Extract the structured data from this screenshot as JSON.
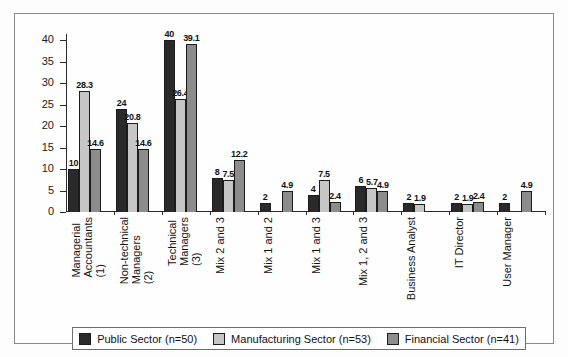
{
  "chart_data": {
    "type": "bar",
    "title": "",
    "subtitle": "",
    "xlabel": "",
    "ylabel": "",
    "ylim": [
      0,
      41.5
    ],
    "yticks": [
      0,
      5,
      10,
      15,
      20,
      25,
      30,
      35,
      40
    ],
    "grid": false,
    "legend_position": "bottom",
    "orientation": "vertical",
    "grouping": "grouped",
    "categories": [
      "Managerial Accountants (1)",
      "Non-technical Managers (2)",
      "Technical Managers (3)",
      "Mix 2 and 3",
      "Mix 1 and 2",
      "Mix 1 and 3",
      "Mix 1, 2 and 3",
      "Business Analyst",
      "IT Director",
      "User Manager"
    ],
    "category_lines": [
      [
        "Managerial",
        "Accountants",
        "(1)"
      ],
      [
        "Non-technical",
        "Managers",
        "(2)"
      ],
      [
        "Technical",
        "Managers",
        "(3)"
      ],
      [
        "Mix 2 and 3"
      ],
      [
        "Mix 1 and 2"
      ],
      [
        "Mix 1 and 3"
      ],
      [
        "Mix 1, 2 and 3"
      ],
      [
        "Business Analyst"
      ],
      [
        "IT Director"
      ],
      [
        "User Manager"
      ]
    ],
    "series": [
      {
        "name": "Public Sector (n=50)",
        "color": "#2a2a2a",
        "values": [
          10,
          24,
          40,
          8,
          2,
          4,
          6,
          2,
          2,
          2
        ],
        "labels": [
          "10",
          "24",
          "40",
          "8",
          "2",
          "4",
          "6",
          "2",
          "2",
          "2"
        ]
      },
      {
        "name": "Manufacturing Sector (n=53)",
        "color": "#c6c6c6",
        "values": [
          28.3,
          20.8,
          26.4,
          7.5,
          null,
          7.5,
          5.7,
          1.9,
          1.9,
          null
        ],
        "labels": [
          "28.3",
          "20.8",
          "26.4",
          "7.5",
          "",
          "7.5",
          "5.7",
          "1.9",
          "1.9",
          ""
        ]
      },
      {
        "name": "Financial Sector (n=41)",
        "color": "#8c8c8c",
        "values": [
          14.6,
          14.6,
          39.1,
          12.2,
          4.9,
          2.4,
          4.9,
          null,
          2.4,
          4.9
        ],
        "labels": [
          "14.6",
          "14.6",
          "39.1",
          "12.2",
          "4.9",
          "2.4",
          "4.9",
          "",
          "2.4",
          "4.9"
        ]
      }
    ]
  },
  "legend": {
    "items": [
      {
        "label": "Public Sector (n=50)",
        "color": "#2a2a2a"
      },
      {
        "label": "Manufacturing Sector (n=53)",
        "color": "#c6c6c6"
      },
      {
        "label": "Financial Sector (n=41)",
        "color": "#8c8c8c"
      }
    ]
  },
  "axis": {
    "y_tick_labels": [
      "40",
      "35",
      "30",
      "25",
      "20",
      "15",
      "10",
      "5",
      "0"
    ]
  }
}
